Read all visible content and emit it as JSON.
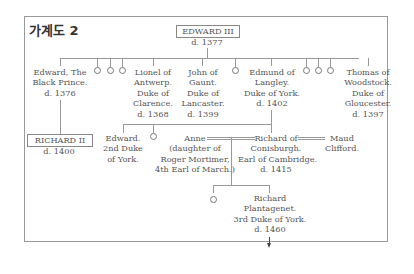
{
  "title": "가계도 2",
  "root": {
    "name": "EDWARD III",
    "death": "d. 1377"
  },
  "children": [
    {
      "lines": [
        "Edward, The",
        "Black Prince.",
        "d. 1376"
      ]
    },
    {
      "lines": [
        "Lionel of",
        "Antwerp.",
        "Duke of",
        "Clarence.",
        "d. 1368"
      ]
    },
    {
      "lines": [
        "John of",
        "Gaunt.",
        "Duke of",
        "Lancaster.",
        "d. 1399"
      ]
    },
    {
      "lines": [
        "Edmund of",
        "Langley.",
        "Duke of York.",
        "d. 1402"
      ]
    },
    {
      "lines": [
        "Thomas of",
        "Woodstock.",
        "Duke of",
        "Gloucester.",
        "d. 1397"
      ]
    }
  ],
  "richard2": {
    "name": "RICHARD II",
    "death": "d. 1400"
  },
  "edward2nd": {
    "lines": [
      "Edward.",
      "2nd Duke",
      "of York."
    ]
  },
  "anne": {
    "lines": [
      "Anne",
      "(daughter of",
      "Roger Mortimer,",
      "4th Earl of March.)"
    ]
  },
  "richardConisburgh": {
    "lines": [
      "Richard of",
      "Conisburgh.",
      "Earl of Cambridge.",
      "d. 1415"
    ]
  },
  "maud": {
    "lines": [
      "Maud",
      "Clifford."
    ]
  },
  "richardPlantagenet": {
    "lines": [
      "Richard",
      "Plantagenet.",
      "3rd Duke of  York.",
      "d. 1460"
    ]
  }
}
